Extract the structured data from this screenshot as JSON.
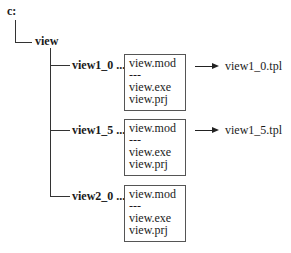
{
  "root": {
    "label": "c:"
  },
  "folder": {
    "label": "view"
  },
  "versions": [
    {
      "label": "view1_0 ...",
      "files": [
        "view.mod",
        "---",
        "view.exe",
        "view.prj"
      ],
      "output": "view1_0.tpl"
    },
    {
      "label": "view1_5 ...",
      "files": [
        "view.mod",
        "---",
        "view.exe",
        "view.prj"
      ],
      "output": "view1_5.tpl"
    },
    {
      "label": "view2_0 ...",
      "files": [
        "view.mod",
        "---",
        "view.exe",
        "view.prj"
      ],
      "output": null
    }
  ]
}
